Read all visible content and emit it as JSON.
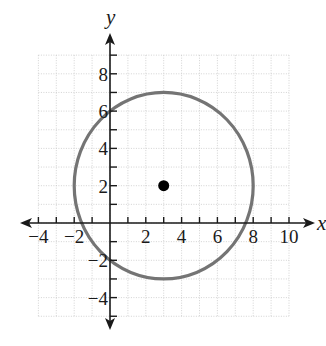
{
  "chart_data": {
    "type": "scatter",
    "title": "",
    "xlabel": "x",
    "ylabel": "y",
    "xlim": [
      -4,
      10
    ],
    "ylim": [
      -5,
      9
    ],
    "grid": true,
    "grid_step": 1,
    "x_ticks": [
      -4,
      -3,
      -2,
      -1,
      1,
      2,
      3,
      4,
      5,
      6,
      7,
      8,
      9,
      10
    ],
    "x_tick_labels": [
      {
        "value": -4,
        "text": "−4"
      },
      {
        "value": -2,
        "text": "−2"
      },
      {
        "value": 2,
        "text": "2"
      },
      {
        "value": 4,
        "text": "4"
      },
      {
        "value": 6,
        "text": "6"
      },
      {
        "value": 8,
        "text": "8"
      },
      {
        "value": 10,
        "text": "10"
      }
    ],
    "y_ticks": [
      -5,
      -4,
      -3,
      -2,
      -1,
      1,
      2,
      3,
      4,
      5,
      6,
      7,
      8,
      9
    ],
    "y_tick_labels": [
      {
        "value": 8,
        "text": "8"
      },
      {
        "value": 6,
        "text": "6"
      },
      {
        "value": 4,
        "text": "4"
      },
      {
        "value": 2,
        "text": "2"
      },
      {
        "value": -2,
        "text": "−2"
      },
      {
        "value": -4,
        "text": "−4"
      }
    ],
    "circle": {
      "center": [
        3,
        2
      ],
      "radius": 5,
      "color": "#747474"
    },
    "points": [
      {
        "x": 3,
        "y": 2,
        "label": "center",
        "color": "#000000"
      }
    ],
    "legend": null
  },
  "layout": {
    "origin_px": [
      110,
      223
    ],
    "x_unit_px": 17.9,
    "y_unit_px": 18.65,
    "x_axis_arrow_px": [
      20,
      315
    ],
    "y_axis_arrow_px": [
      33,
      330
    ]
  }
}
